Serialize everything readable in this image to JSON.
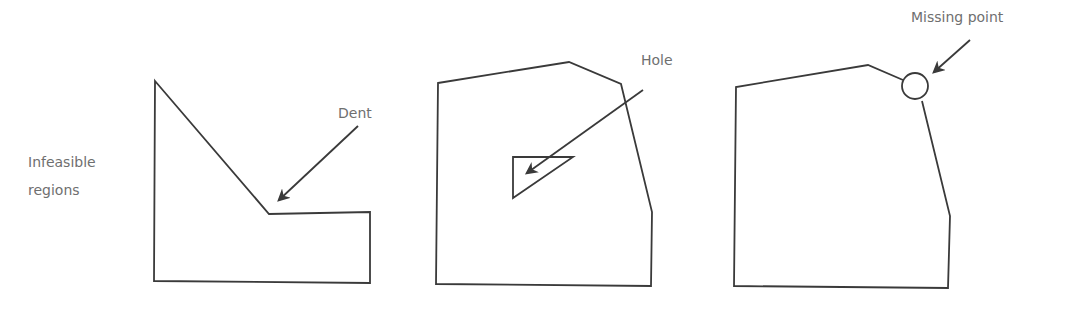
{
  "labels": {
    "infeasible_line1": "Infeasible",
    "infeasible_line2": "regions",
    "dent": "Dent",
    "hole": "Hole",
    "missing_point": "Missing point"
  },
  "colors": {
    "stroke": "#3a3a3a",
    "label": "#6f6f6f",
    "background": "#ffffff"
  }
}
